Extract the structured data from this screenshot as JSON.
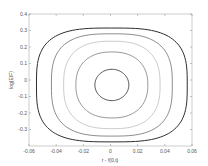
{
  "chart_data": {
    "type": "line",
    "subtype": "contour",
    "title": "",
    "xlabel": "r - f(0,t)",
    "ylabel": "log(E/F)",
    "xlim": [
      -0.06,
      0.06
    ],
    "ylim": [
      -0.4,
      0.4
    ],
    "xticks": [
      -0.06,
      -0.04,
      -0.02,
      0,
      0.02,
      0.04,
      0.06
    ],
    "xtick_labels": [
      "-0.06",
      "-0.04",
      "-0.02",
      "0",
      "0.02",
      "0.04",
      "0.06"
    ],
    "yticks": [
      -0.3,
      -0.2,
      -0.1,
      0,
      0.1,
      0.2,
      0.3,
      0.4
    ],
    "ytick_labels": [
      "-0.3",
      "-0.2",
      "-0.1",
      "0",
      "0.1",
      "0.2",
      "0.3",
      "0.4"
    ],
    "grid": false,
    "legend": null,
    "series": [
      {
        "name": "contour-1",
        "center": [
          0.001,
          -0.03
        ],
        "half_width_x": 0.0125,
        "half_height_y": 0.095,
        "squareness": 2.0,
        "color": "#3a3a3a",
        "width": 0.9
      },
      {
        "name": "contour-2",
        "center": [
          0.001,
          -0.03
        ],
        "half_width_x": 0.0265,
        "half_height_y": 0.2,
        "squareness": 2.3,
        "color": "#6a6a6a",
        "width": 0.7
      },
      {
        "name": "contour-3",
        "center": [
          0.001,
          -0.03
        ],
        "half_width_x": 0.0355,
        "half_height_y": 0.265,
        "squareness": 2.6,
        "color": "#b5b5b5",
        "width": 0.7
      },
      {
        "name": "contour-4",
        "center": [
          0.001,
          -0.03
        ],
        "half_width_x": 0.0445,
        "half_height_y": 0.31,
        "squareness": 2.9,
        "color": "#5a5a5a",
        "width": 0.7
      },
      {
        "name": "contour-5",
        "center": [
          0.001,
          -0.03
        ],
        "half_width_x": 0.0555,
        "half_height_y": 0.345,
        "squareness": 3.2,
        "color": "#2e2e2e",
        "width": 1.0
      }
    ],
    "plot_area_px": {
      "left": 29,
      "right": 192,
      "top": 14,
      "bottom": 146
    }
  }
}
